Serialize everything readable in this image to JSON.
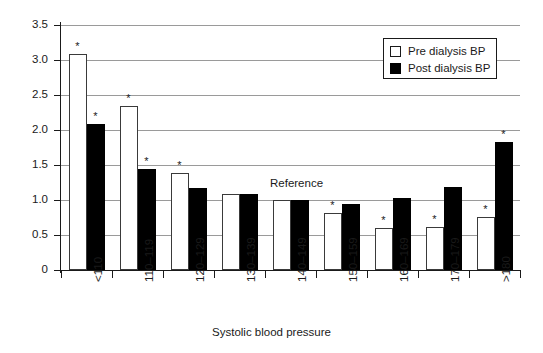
{
  "chart_data": {
    "type": "bar",
    "title": "",
    "xlabel": "Systolic blood pressure",
    "ylabel": "Relative risk",
    "categories": [
      "<110",
      "110–119",
      "120–129",
      "130–139",
      "140–149",
      "150–159",
      "160–169",
      "170–179",
      ">180"
    ],
    "series": [
      {
        "name": "Pre dialysis BP",
        "color": "#ffffff",
        "values": [
          3.08,
          2.35,
          1.38,
          1.09,
          1.0,
          0.81,
          0.6,
          0.61,
          0.76
        ],
        "significant": [
          true,
          true,
          true,
          false,
          false,
          true,
          true,
          true,
          true
        ]
      },
      {
        "name": "Post dialysis BP",
        "color": "#000000",
        "values": [
          2.09,
          1.45,
          1.17,
          1.09,
          1.0,
          0.95,
          1.03,
          1.18,
          1.83
        ],
        "significant": [
          true,
          true,
          false,
          false,
          false,
          false,
          false,
          false,
          true
        ]
      }
    ],
    "ylim": [
      0,
      3.5
    ],
    "yticks": [
      "0",
      "0.5",
      "1.0",
      "1.5",
      "2.0",
      "2.5",
      "3.0",
      "3.5"
    ],
    "ytick_values": [
      0,
      0.5,
      1.0,
      1.5,
      2.0,
      2.5,
      3.0,
      3.5
    ],
    "grid": true,
    "grid_color": "#9a9a9a",
    "legend_position": "top-right",
    "significance_marker": "*",
    "annotations": [
      {
        "text": "Reference",
        "category": "140–149",
        "value": 1.0
      }
    ]
  },
  "legend": {
    "items": [
      {
        "label": "Pre dialysis BP",
        "swatch": "open-square-swatch"
      },
      {
        "label": "Post dialysis BP",
        "swatch": "filled-square-swatch"
      }
    ]
  },
  "axes": {
    "y_title": "Relative risk",
    "x_title": "Systolic blood pressure"
  },
  "annotations": {
    "reference": "Reference"
  }
}
